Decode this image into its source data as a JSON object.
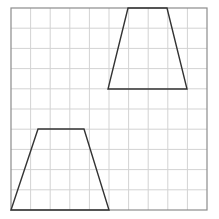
{
  "diagram": {
    "type": "grid-with-shapes",
    "grid": {
      "columns": 10,
      "rows": 10,
      "left": 11,
      "top": 8,
      "right": 207,
      "bottom": 210,
      "line_color": "#d3d3d3",
      "border_color": "#8c8c8c"
    },
    "shapes": [
      {
        "name": "trapezoid-upper-right",
        "stroke": "#333333",
        "points": [
          [
            128,
            8
          ],
          [
            167,
            8
          ],
          [
            187,
            89
          ],
          [
            108,
            89
          ]
        ]
      },
      {
        "name": "trapezoid-lower-left",
        "stroke": "#333333",
        "points": [
          [
            38,
            129
          ],
          [
            84,
            129
          ],
          [
            109,
            210
          ],
          [
            11,
            210
          ]
        ]
      }
    ]
  }
}
